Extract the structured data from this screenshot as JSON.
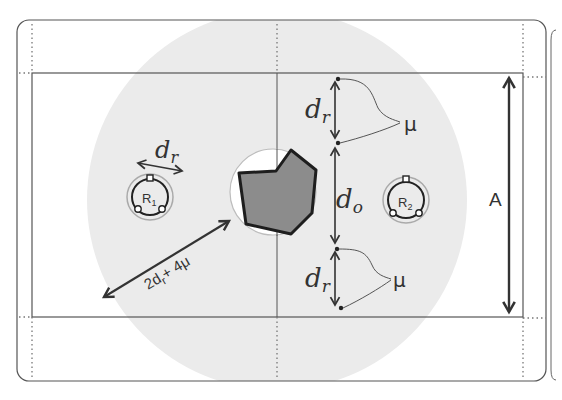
{
  "diagram": {
    "colors": {
      "frame": "#555555",
      "zone_fill": "#ebebeb",
      "obstacle_fill": "#8c8c8c",
      "obstacle_stroke": "#1e1e1e",
      "arrow": "#333333",
      "clearance_circle": "#ffffff"
    },
    "robots": [
      {
        "id": "R1",
        "label": "R",
        "subscript": "1"
      },
      {
        "id": "R2",
        "label": "R",
        "subscript": "2"
      }
    ],
    "labels": {
      "robot_diameter": {
        "symbol": "d",
        "subscript": "r"
      },
      "obstacle_diameter": {
        "symbol": "d",
        "subscript": "o"
      },
      "top_gap": {
        "symbol": "d",
        "subscript": "r"
      },
      "bottom_gap": {
        "symbol": "d",
        "subscript": "r"
      },
      "mu_top": "μ",
      "mu_bottom": "μ",
      "radius_label": "2d",
      "radius_label_sub": "r",
      "radius_label_tail": "+ 4μ",
      "side_length": "A"
    }
  }
}
